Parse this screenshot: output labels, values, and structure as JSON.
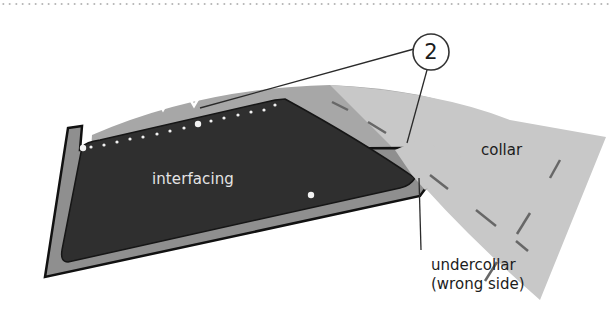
{
  "diagram": {
    "type": "sewing-illustration",
    "callout": {
      "number": "2"
    },
    "labels": {
      "interfacing": "interfacing",
      "collar": "collar",
      "undercollar_line1": "undercollar",
      "undercollar_line2": "(wrong side)"
    },
    "colors": {
      "interfacing": "#2e2e2e",
      "undercollar": "#8f8f8f",
      "collar": "#c6c6c6",
      "collar_back": "#a5a5a5",
      "outline": "#111111",
      "stitch_dash": "#6a6a6a",
      "dot_divider": "#a8a8a8"
    }
  }
}
